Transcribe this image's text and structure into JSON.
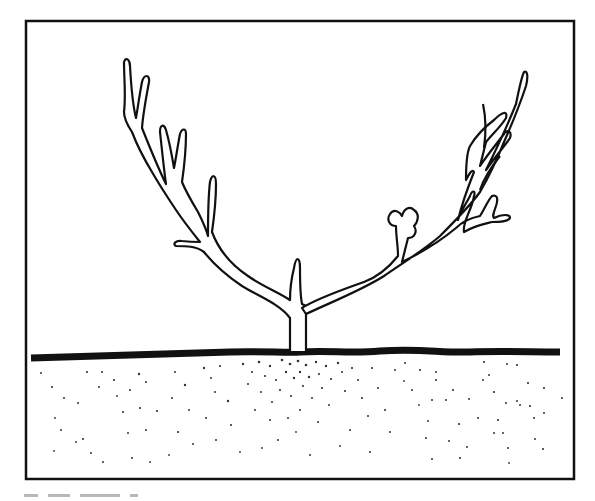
{
  "figure": {
    "colors": {
      "ink": "#111111",
      "paper": "#ffffff",
      "caption_ghost": "#b8b8b8"
    },
    "frame": {
      "x": 26,
      "y": 21,
      "width": 548,
      "height": 458,
      "stroke": 2.5
    },
    "ground": {
      "y": 357,
      "thickness": 7,
      "path": "M31,358 C90,356 160,354 230,352 C260,351 290,353 300,352 C330,350 350,354 380,351 C420,348 440,353 470,352 C500,351 530,352 560,352"
    },
    "caption": {
      "text": "",
      "note": "caption clipped at image bottom; only tops of glyphs visible"
    }
  }
}
